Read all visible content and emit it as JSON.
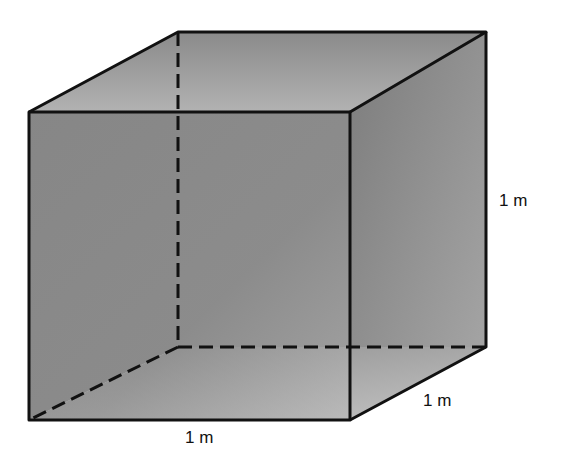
{
  "diagram": {
    "type": "cube",
    "title": "",
    "labels": {
      "height": "1 m",
      "depth": "1 m",
      "width": "1 m"
    },
    "colors": {
      "edge": "#111111",
      "face_dark": "#7f7f7f",
      "face_mid": "#8e8e8e",
      "face_light": "#bdbdbd",
      "background": "#ffffff"
    }
  }
}
